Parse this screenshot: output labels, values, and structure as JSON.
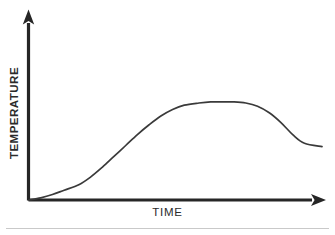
{
  "figure": {
    "background_color": "#ffffff",
    "width": 335,
    "height": 235,
    "axis_color": "#262626",
    "curve_color": "#3a3a3a",
    "footer_rule_color": "#c9c9c9"
  },
  "axes": {
    "y_label": "TEMPERATURE",
    "x_label": "TIME",
    "y_arrow_icon": "arrow-up-icon",
    "x_arrow_icon": "arrow-right-icon"
  },
  "chart_data": {
    "type": "line",
    "title": "",
    "subtitle": "",
    "xlabel": "TIME",
    "ylabel": "TEMPERATURE",
    "xlim": [
      0,
      100
    ],
    "ylim": [
      0,
      100
    ],
    "grid": false,
    "legend": null,
    "axis_ticks": {
      "x": [],
      "y": []
    },
    "annotations": [],
    "series": [
      {
        "name": "temperature",
        "color": "#3a3a3a",
        "x": [
          0,
          4,
          8,
          12,
          17,
          21,
          25,
          29,
          33,
          37,
          41,
          45,
          49,
          53,
          58,
          62,
          66,
          70,
          74,
          78,
          82,
          86,
          90,
          94,
          100
        ],
        "y": [
          0,
          2,
          5,
          9,
          14,
          21,
          30,
          40,
          50,
          60,
          69,
          77,
          83,
          87,
          89,
          90,
          90,
          90,
          89,
          86,
          80,
          71,
          60,
          52,
          49
        ]
      }
    ],
    "shape_description": "sigmoidal rise from origin to a broad flat plateau, followed by a gradual decline that levels off near the right edge"
  }
}
